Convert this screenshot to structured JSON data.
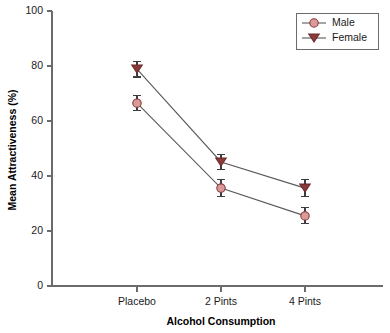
{
  "chart_data": {
    "type": "line",
    "title": "",
    "xlabel": "Alcohol Consumption",
    "ylabel": "Mean Attractiveness (%)",
    "categories": [
      "Placebo",
      "2 Pints",
      "4 Pints"
    ],
    "ylim": [
      0,
      100
    ],
    "yticks": [
      0,
      20,
      40,
      60,
      80,
      100
    ],
    "ytick_labels": [
      "0",
      "20",
      "40",
      "60",
      "80",
      "100"
    ],
    "grid": false,
    "legend_position": "top-right",
    "error_bars": "standard error",
    "series": [
      {
        "name": "Male",
        "marker": "circle",
        "color": "#d99a99",
        "edge_color": "#8a3a3a",
        "values": [
          66.5,
          35.6,
          25.5
        ],
        "errors": [
          2.8,
          3.1,
          2.9
        ]
      },
      {
        "name": "Female",
        "marker": "triangle-down",
        "color": "#8b3a3a",
        "edge_color": "#6d2b2b",
        "values": [
          78.9,
          45.1,
          35.6
        ],
        "errors": [
          2.9,
          2.7,
          3.0
        ]
      }
    ]
  },
  "legend": {
    "entries": [
      {
        "label": "Male"
      },
      {
        "label": "Female"
      }
    ]
  },
  "axes": {
    "y_title": "Mean Attractiveness (%)",
    "x_title": "Alcohol Consumption"
  }
}
